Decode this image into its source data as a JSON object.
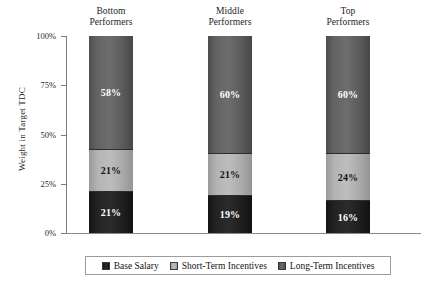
{
  "chart_data": {
    "type": "bar",
    "subtype": "stacked-100-percent",
    "title": "",
    "xlabel": "",
    "ylabel": "Weight in Target TDC",
    "ylim": [
      0,
      100
    ],
    "grid": false,
    "legend_position": "bottom",
    "categories": [
      "Bottom Performers",
      "Middle Performers",
      "Top Performers"
    ],
    "category_lines": [
      {
        "line1": "Bottom",
        "line2": "Performers"
      },
      {
        "line1": "Middle",
        "line2": "Performers"
      },
      {
        "line1": "Top",
        "line2": "Performers"
      }
    ],
    "y_ticks": [
      "0%",
      "25%",
      "50%",
      "75%",
      "100%"
    ],
    "y_tick_values": [
      0,
      25,
      50,
      75,
      100
    ],
    "series": [
      {
        "name": "Base Salary",
        "color": "#1f1f1f",
        "values": [
          21,
          19,
          16
        ],
        "labels": [
          "21%",
          "19%",
          "16%"
        ],
        "label_color": "#ffffff"
      },
      {
        "name": "Short-Term Incentives",
        "color": "#b4b4b4",
        "values": [
          21,
          21,
          24
        ],
        "labels": [
          "21%",
          "21%",
          "24%"
        ],
        "label_color": "#141414"
      },
      {
        "name": "Long-Term Incentives",
        "color": "#666666",
        "values": [
          58,
          60,
          60
        ],
        "labels": [
          "58%",
          "60%",
          "60%"
        ],
        "label_color": "#ffffff"
      }
    ]
  },
  "legend": {
    "items": [
      {
        "label": "Base Salary",
        "swatch": "legend-swatch-base-salary"
      },
      {
        "label": "Short-Term Incentives",
        "swatch": "legend-swatch-short-term"
      },
      {
        "label": "Long-Term Incentives",
        "swatch": "legend-swatch-long-term"
      }
    ]
  },
  "axes": {
    "y_title": "Weight in Target TDC"
  },
  "colors": {
    "base_salary": "#1f1f1f",
    "short_term": "#b4b4b4",
    "long_term": "#666666",
    "axis": "#7d7d7d",
    "text": "#1a1a1a",
    "legend_border": "#9c9c9c"
  }
}
